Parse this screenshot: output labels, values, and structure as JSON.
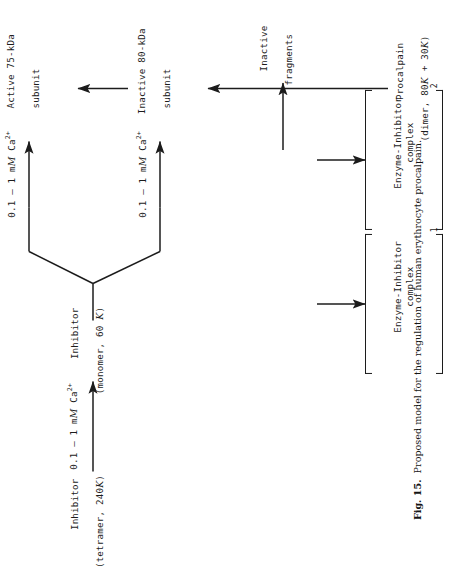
{
  "figure": {
    "number_label": "Fig. 15.",
    "caption_text": "Proposed model for the regulation of human erythrocyte procalpain.",
    "orientation": "rotated-90-ccw"
  },
  "nodes": {
    "inhibitor_tetramer": {
      "line1": "Inhibitor",
      "line2_pre": "(tetramer, 240",
      "line2_unit": "K",
      "line2_post": ")"
    },
    "inhibitor_monomer": {
      "line1": "Inhibitor",
      "line2_pre": "(monomer, 60 ",
      "line2_unit": "K",
      "line2_post": ")"
    },
    "procalpain": {
      "line1": "Procalpain",
      "line2_pre": "(dimer, 80",
      "line2_unit": "K",
      "line2_mid": " + 30",
      "line2_unit2": "K",
      "line2_post": ")"
    },
    "inactive_80kda": {
      "line1": "Inactive 80-kDa",
      "line2": "subunit"
    },
    "active_75kda": {
      "line1": "Active 75-kDa",
      "line2": "subunit"
    },
    "inactive_fragments": {
      "line1": "Inactive",
      "line2": "fragments"
    },
    "complex_1": {
      "line1": "Enzyme-Inhibitor",
      "line2": "complex",
      "subscript": "1"
    },
    "complex_2": {
      "line1": "Enzyme-Inhibitor",
      "line2": "complex",
      "subscript": "2"
    }
  },
  "reaction_labels": {
    "ca_tetramer_to_monomer": {
      "conc": "0.1 – 1 m",
      "molar": "M",
      "species": " Ca",
      "charge": "2+"
    },
    "ca_upper_branch": {
      "conc": "0.1 – 1 m",
      "molar": "M",
      "species": " Ca",
      "charge": "2+"
    },
    "ca_lower_branch": {
      "conc": "0.1 – 1 m",
      "molar": "M",
      "species": " Ca",
      "charge": "2+"
    }
  },
  "colors": {
    "ink": "#1c1c1c",
    "background": "#ffffff"
  }
}
